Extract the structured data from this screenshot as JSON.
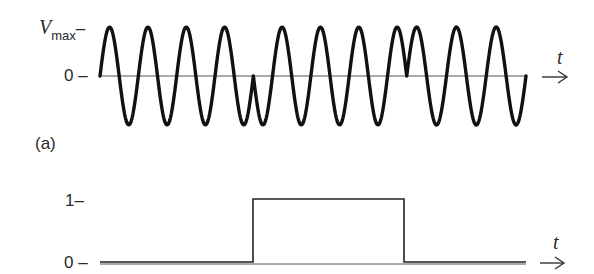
{
  "panel_a": {
    "label": "(a)",
    "y_labels": {
      "vmax_main": "V",
      "vmax_sub": "max",
      "vmax_tick": "–",
      "zero": "0",
      "zero_tick": "–"
    },
    "axis_label": "t",
    "description": "Phase-shift keyed carrier: sinusoid with 180° phase reversals at bit transitions"
  },
  "panel_b": {
    "y_labels": {
      "one": "1",
      "one_tick": "–",
      "zero": "0",
      "zero_tick": "–"
    },
    "axis_label": "t",
    "description": "Binary data signal: 0 then 1 then 0"
  },
  "chart_data": [
    {
      "type": "line",
      "title": "(a) PSK modulated carrier",
      "xlabel": "t",
      "ylabel": "",
      "y_ticks": [
        "0",
        "Vmax"
      ],
      "segments": [
        {
          "x_range": [
            0,
            0.36
          ],
          "bit": 0,
          "phase_deg": 0,
          "cycles": 4
        },
        {
          "x_range": [
            0.36,
            0.72
          ],
          "bit": 1,
          "phase_deg": 180,
          "cycles": 4
        },
        {
          "x_range": [
            0.72,
            1.0
          ],
          "bit": 0,
          "phase_deg": 0,
          "cycles": 3
        }
      ],
      "phase_reversals_at": [
        0.36,
        0.72
      ],
      "amplitude": "Vmax"
    },
    {
      "type": "line",
      "title": "Binary data",
      "xlabel": "t",
      "ylabel": "",
      "y_ticks": [
        "0",
        "1"
      ],
      "x": [
        0,
        0.36,
        0.36,
        0.72,
        0.72,
        1.0
      ],
      "values": [
        0,
        0,
        1,
        1,
        0,
        0
      ],
      "ylim": [
        0,
        1
      ]
    }
  ]
}
